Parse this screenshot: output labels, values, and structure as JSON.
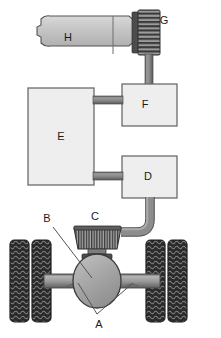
{
  "diagram": {
    "background_color": "#ffffff",
    "labels": {
      "a": "A",
      "b": "B",
      "c": "C",
      "d": "D",
      "e": "E",
      "f": "F",
      "g": "G",
      "h": "H"
    },
    "components": [
      {
        "id": "h",
        "label": "H",
        "shape": "engine-block",
        "fill": "#c9c9c9",
        "stroke": "#4d4d4d",
        "label_x": 68,
        "label_y": 38
      },
      {
        "id": "g",
        "label": "G",
        "shape": "knurled-gear",
        "fill": "#6e6e6e",
        "stroke": "#333333",
        "label_x": 164,
        "label_y": 21
      },
      {
        "id": "f",
        "label": "F",
        "shape": "rectangle",
        "fill": "#eeeeee",
        "stroke": "#6b6b6b",
        "label_x": 145,
        "label_y": 105
      },
      {
        "id": "e",
        "label": "E",
        "shape": "rectangle",
        "fill": "#eeeeee",
        "stroke": "#6b6b6b",
        "label_x": 61,
        "label_y": 137
      },
      {
        "id": "d",
        "label": "D",
        "shape": "rectangle",
        "fill": "#eeeeee",
        "stroke": "#6b6b6b",
        "label_x": 148,
        "label_y": 177
      },
      {
        "id": "c",
        "label": "C",
        "shape": "knurled-drum",
        "fill": "#6e6e6e",
        "stroke": "#303030",
        "label_x": 95,
        "label_y": 217
      },
      {
        "id": "b",
        "label": "B",
        "shape": "differential-housing",
        "fill": "#a8a8a8",
        "stroke": "#3a3a3a",
        "label_x": 47,
        "label_y": 219
      },
      {
        "id": "a",
        "label": "A",
        "shape": "axle-shaft-callout",
        "fill": "#9a9a9a",
        "stroke": "#3a3a3a",
        "label_x": 99,
        "label_y": 323
      }
    ],
    "wheels": {
      "count": 4,
      "arrangement": "dual-pair-left, dual-pair-right",
      "tread_color": "#2e2e2e",
      "rim_color": "#555555"
    },
    "connectors": [
      {
        "from": "g",
        "to": "f",
        "orientation": "vertical"
      },
      {
        "from": "e",
        "to": "f",
        "orientation": "horizontal"
      },
      {
        "from": "e",
        "to": "d",
        "orientation": "horizontal"
      },
      {
        "from": "d",
        "to": "c",
        "orientation": "curved"
      },
      {
        "from": "h",
        "to": "g",
        "orientation": "horizontal"
      }
    ],
    "colors": {
      "pipe": "#8a8a8a",
      "pipe_edge": "#5a5a5a",
      "box_fill": "#eeeeee",
      "box_stroke": "#6b6b6b",
      "label": "#1a1a1a",
      "leader_line": "#555555"
    }
  }
}
